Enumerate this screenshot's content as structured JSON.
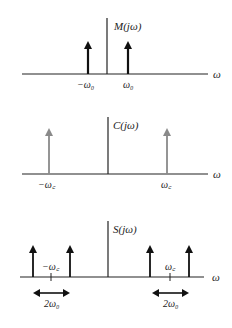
{
  "panels": [
    {
      "id": "message-spectrum",
      "title": "M(jω)",
      "axis_label": "ω",
      "impulse_color": "#111111",
      "impulses": [
        {
          "x": 88,
          "label": "−ω₀"
        },
        {
          "x": 128,
          "label": "ω₀"
        }
      ]
    },
    {
      "id": "carrier-spectrum",
      "title": "C(jω)",
      "axis_label": "ω",
      "impulse_color": "#8a8a8a",
      "impulses": [
        {
          "x": 49,
          "label": "−ω꜀"
        },
        {
          "x": 167,
          "label": "ω꜀"
        }
      ]
    },
    {
      "id": "modulated-spectrum",
      "title": "S(jω)",
      "axis_label": "ω",
      "impulse_color": "#111111",
      "center_ticks": [
        {
          "x": 51,
          "label": "−ω꜀"
        },
        {
          "x": 170,
          "label": "ω꜀"
        }
      ],
      "spans": [
        {
          "x1": 33,
          "x2": 70,
          "label": "2ω₀"
        },
        {
          "x1": 152,
          "x2": 189,
          "label": "2ω₀"
        }
      ]
    }
  ]
}
